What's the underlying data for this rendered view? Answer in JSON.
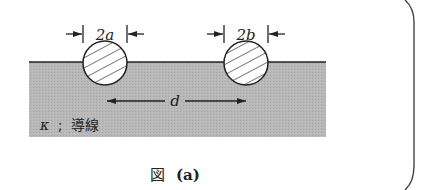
{
  "figure": {
    "caption": "図 (a)",
    "caption_prefix": "図",
    "caption_suffix": "(a)"
  },
  "region": {
    "label_symbol": "κ",
    "label_sep": ";",
    "label_text": "導線",
    "fill_color": "#b4b4b4"
  },
  "wires": [
    {
      "name": "wire-a",
      "diameter_label": "2a",
      "center": [
        105,
        63
      ],
      "radius": 22
    },
    {
      "name": "wire-b",
      "diameter_label": "2b",
      "center": [
        246,
        63
      ],
      "radius": 22
    }
  ],
  "distance": {
    "label": "d"
  },
  "colors": {
    "line": "#222222",
    "background": "#ffffff"
  }
}
